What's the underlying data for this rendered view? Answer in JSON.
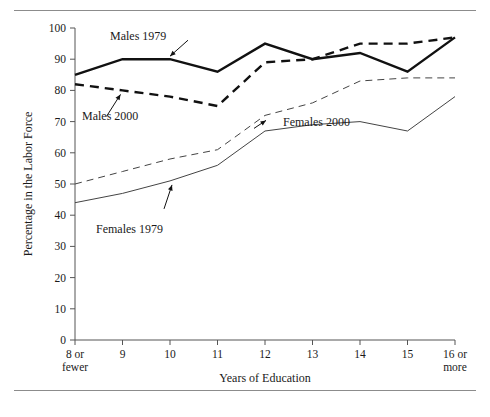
{
  "figure": {
    "top_rule": "horizontal-rule",
    "bottom_rule": "horizontal-rule"
  },
  "chart_data": {
    "type": "line",
    "title": "",
    "xlabel": "Years of Education",
    "ylabel": "Percentage in the Labor Force",
    "categories": [
      "8 or fewer",
      "9",
      "10",
      "11",
      "12",
      "13",
      "14",
      "15",
      "16 or more"
    ],
    "category_lines": [
      [
        "8 or",
        "fewer"
      ],
      [
        "9"
      ],
      [
        "10"
      ],
      [
        "11"
      ],
      [
        "12"
      ],
      [
        "13"
      ],
      [
        "14"
      ],
      [
        "15"
      ],
      [
        "16 or",
        "more"
      ]
    ],
    "ylim": [
      0,
      100
    ],
    "yticks": [
      0,
      10,
      20,
      30,
      40,
      50,
      60,
      70,
      80,
      90,
      100
    ],
    "grid": false,
    "legend_position": "inline-annotations",
    "series": [
      {
        "name": "Males 1979",
        "style": "solid-thick",
        "color": "#111111",
        "values": [
          85,
          90,
          90,
          86,
          95,
          90,
          92,
          86,
          97
        ],
        "label": "Males 1979"
      },
      {
        "name": "Males 2000",
        "style": "dashed-thick",
        "color": "#111111",
        "values": [
          82,
          80,
          78,
          75,
          89,
          90,
          95,
          95,
          97
        ],
        "label": "Males 2000"
      },
      {
        "name": "Females 2000",
        "style": "dashed-thin",
        "color": "#444444",
        "values": [
          50,
          54,
          58,
          61,
          72,
          76,
          83,
          84,
          84
        ],
        "label": "Females 2000"
      },
      {
        "name": "Females 1979",
        "style": "solid-thin",
        "color": "#444444",
        "values": [
          44,
          47,
          51,
          56,
          67,
          69,
          70,
          67,
          78
        ],
        "label": "Females 1979"
      }
    ],
    "annotations": [
      {
        "text": "Males 1979",
        "target_series": "Males 1979",
        "target_index": 2
      },
      {
        "text": "Males 2000",
        "target_series": "Males 2000",
        "target_index": 1
      },
      {
        "text": "Females 2000",
        "target_series": "Females 2000",
        "target_index": 4
      },
      {
        "text": "Females 1979",
        "target_series": "Females 1979",
        "target_index": 2
      }
    ]
  }
}
